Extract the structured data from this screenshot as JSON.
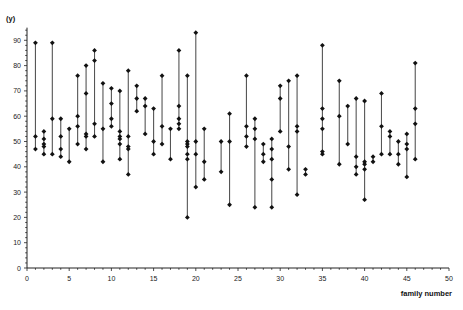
{
  "chart_data": {
    "type": "scatter",
    "subtype": "vertical-range-dot-plot",
    "title": "",
    "xlabel": "family number",
    "ylabel": "(y)",
    "xlim": [
      0,
      50
    ],
    "ylim": [
      0,
      95
    ],
    "x_ticks": [
      0,
      5,
      10,
      15,
      20,
      25,
      30,
      35,
      40,
      45,
      50
    ],
    "y_ticks": [
      0,
      10,
      20,
      30,
      40,
      50,
      60,
      70,
      80,
      90
    ],
    "grid": false,
    "legend": null,
    "marker_color": "#111111",
    "line_color": "#555555",
    "families": [
      {
        "x": 1,
        "values": [
          89,
          52,
          47
        ]
      },
      {
        "x": 2,
        "values": [
          54,
          51,
          49,
          48,
          45
        ]
      },
      {
        "x": 3,
        "values": [
          89,
          59,
          45
        ]
      },
      {
        "x": 4,
        "values": [
          59,
          52,
          47,
          44
        ]
      },
      {
        "x": 5,
        "values": [
          55,
          42
        ]
      },
      {
        "x": 6,
        "values": [
          76,
          60,
          56,
          49
        ]
      },
      {
        "x": 7,
        "values": [
          80,
          69,
          53,
          52,
          47
        ]
      },
      {
        "x": 8,
        "values": [
          86,
          82,
          57,
          52
        ]
      },
      {
        "x": 9,
        "values": [
          73,
          55,
          42
        ]
      },
      {
        "x": 10,
        "values": [
          71,
          65,
          59,
          56
        ]
      },
      {
        "x": 11,
        "values": [
          70,
          54,
          52,
          51,
          49,
          43
        ]
      },
      {
        "x": 12,
        "values": [
          78,
          52,
          48,
          47,
          37
        ]
      },
      {
        "x": 13,
        "values": [
          72,
          67,
          62
        ]
      },
      {
        "x": 14,
        "values": [
          67,
          64,
          53
        ]
      },
      {
        "x": 15,
        "values": [
          63,
          50,
          45
        ]
      },
      {
        "x": 16,
        "values": [
          76,
          56,
          49
        ]
      },
      {
        "x": 17,
        "values": [
          55,
          43
        ]
      },
      {
        "x": 18,
        "values": [
          86,
          64,
          59,
          57,
          55
        ]
      },
      {
        "x": 19,
        "values": [
          76,
          50,
          49,
          48,
          45,
          43,
          20
        ]
      },
      {
        "x": 20,
        "values": [
          93,
          50,
          45,
          32
        ]
      },
      {
        "x": 21,
        "values": [
          55,
          42,
          35
        ]
      },
      {
        "x": 23,
        "values": [
          50,
          38
        ]
      },
      {
        "x": 24,
        "values": [
          61,
          50,
          25
        ]
      },
      {
        "x": 26,
        "values": [
          76,
          56,
          52,
          48
        ]
      },
      {
        "x": 27,
        "values": [
          59,
          55,
          51,
          24
        ]
      },
      {
        "x": 28,
        "values": [
          49,
          45,
          42
        ]
      },
      {
        "x": 29,
        "values": [
          51,
          47,
          43,
          35,
          24
        ]
      },
      {
        "x": 30,
        "values": [
          72,
          67,
          54
        ]
      },
      {
        "x": 31,
        "values": [
          74,
          48,
          39
        ]
      },
      {
        "x": 32,
        "values": [
          76,
          56,
          54,
          29
        ]
      },
      {
        "x": 33,
        "values": [
          39,
          37
        ]
      },
      {
        "x": 35,
        "values": [
          88,
          63,
          59,
          55,
          46,
          45
        ]
      },
      {
        "x": 37,
        "values": [
          74,
          60,
          41
        ]
      },
      {
        "x": 38,
        "values": [
          64,
          49
        ]
      },
      {
        "x": 39,
        "values": [
          67,
          44,
          40,
          37
        ]
      },
      {
        "x": 40,
        "values": [
          66,
          42,
          41,
          39,
          27
        ]
      },
      {
        "x": 41,
        "values": [
          44,
          42
        ]
      },
      {
        "x": 42,
        "values": [
          69,
          56,
          45
        ]
      },
      {
        "x": 43,
        "values": [
          54,
          52,
          45
        ]
      },
      {
        "x": 44,
        "values": [
          50,
          45,
          41
        ]
      },
      {
        "x": 45,
        "values": [
          53,
          49,
          47,
          36
        ]
      },
      {
        "x": 46,
        "values": [
          81,
          63,
          57,
          43
        ]
      }
    ]
  }
}
